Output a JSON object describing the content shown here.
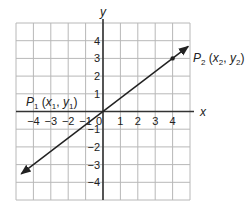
{
  "chart_data": {
    "type": "line",
    "title": "",
    "xlabel": "x",
    "ylabel": "y",
    "xlim": [
      -5,
      5
    ],
    "ylim": [
      -5,
      5
    ],
    "grid": true,
    "x_ticks": [
      -4,
      -3,
      -2,
      -1,
      0,
      1,
      2,
      3,
      4
    ],
    "y_ticks": [
      -4,
      -3,
      -2,
      -1,
      1,
      2,
      3,
      4
    ],
    "x_tick_labels": [
      "−4",
      "−3",
      "−2",
      "−1",
      "0",
      "1",
      "2",
      "3",
      "4"
    ],
    "y_tick_labels": [
      "−4",
      "−3",
      "−2",
      "−1",
      "1",
      "2",
      "3",
      "4"
    ],
    "series": [
      {
        "name": "line through origin",
        "slope": 0.75,
        "x": [
          -4.7,
          4.9
        ],
        "y": [
          -3.525,
          3.675
        ],
        "arrows": "both"
      }
    ],
    "points": [
      {
        "name": "P2",
        "x": 4,
        "y": 3,
        "marked": true
      },
      {
        "name": "P1",
        "x": 0,
        "y": 0,
        "marked": false
      }
    ],
    "annotations": {
      "p1": {
        "main": "P",
        "sub": "1",
        "text": " (x",
        "sub2": "1",
        "mid": ", y",
        "sub3": "1",
        "end": ")"
      },
      "p2": {
        "main": "P",
        "sub": "2",
        "text": " (x",
        "sub2": "2",
        "mid": ", y",
        "sub3": "2",
        "end": ")"
      }
    }
  }
}
